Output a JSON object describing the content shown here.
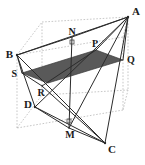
{
  "figure": {
    "background_color": "#ffffff",
    "stroke_color": "#2b2b2b",
    "hidden_edge_color": "#b9b9b9",
    "shade_fill": "#595959",
    "shade_stroke": "#3a3a3a",
    "width": 145,
    "height": 165
  },
  "labels": {
    "A": "A",
    "B": "B",
    "C": "C",
    "D": "D",
    "M": "M",
    "N": "N",
    "P": "P",
    "Q": "Q",
    "R": "R",
    "S": "S"
  },
  "points": {
    "A": {
      "x": 128,
      "y": 17
    },
    "B": {
      "x": 17,
      "y": 55
    },
    "C": {
      "x": 105,
      "y": 143
    },
    "D": {
      "x": 35,
      "y": 107
    },
    "M": {
      "x": 69,
      "y": 128
    },
    "N": {
      "x": 72,
      "y": 37
    },
    "P": {
      "x": 96,
      "y": 50
    },
    "Q": {
      "x": 123,
      "y": 60
    },
    "R": {
      "x": 42,
      "y": 86
    },
    "S": {
      "x": 22,
      "y": 73
    }
  },
  "cube_corners": {
    "front_top_left": {
      "x": 17,
      "y": 55
    },
    "front_top_right": {
      "x": 123,
      "y": 37
    },
    "front_bottom_left": {
      "x": 17,
      "y": 128
    },
    "front_bottom_right": {
      "x": 123,
      "y": 110
    },
    "back_top_left": {
      "x": 42,
      "y": 22
    },
    "back_top_right": {
      "x": 128,
      "y": 17
    },
    "back_bottom_left": {
      "x": 42,
      "y": 95
    },
    "back_bottom_right": {
      "x": 128,
      "y": 90
    }
  },
  "shaded_region": {
    "name": "parallelogram-SPQR-cross-section",
    "vertices": [
      {
        "x": 22,
        "y": 73
      },
      {
        "x": 96,
        "y": 50
      },
      {
        "x": 123,
        "y": 60
      },
      {
        "x": 48,
        "y": 83
      }
    ]
  },
  "solid_edges": [
    {
      "name": "edge-B-A",
      "from": "B",
      "to": "A"
    },
    {
      "name": "edge-B-C",
      "from": "B",
      "to": "C"
    },
    {
      "name": "edge-A-C",
      "from": "A",
      "to": "C"
    },
    {
      "name": "edge-B-D",
      "from": "B",
      "to": "D"
    },
    {
      "name": "edge-D-C",
      "from": "D",
      "to": "C"
    },
    {
      "name": "edge-A-D",
      "from": "A",
      "to": "D"
    },
    {
      "name": "edge-B-N",
      "from": "B",
      "to": "N"
    },
    {
      "name": "edge-N-A",
      "from": "N",
      "to": "A"
    },
    {
      "name": "edge-D-M",
      "from": "D",
      "to": "M"
    },
    {
      "name": "edge-M-C",
      "from": "M",
      "to": "C"
    },
    {
      "name": "edge-A-M",
      "from": "A",
      "to": "M"
    },
    {
      "name": "edge-A-Q",
      "from": "A",
      "to": "Q"
    },
    {
      "name": "edge-B-S",
      "from": "B",
      "to": "S"
    },
    {
      "name": "edge-S-R",
      "from": "S",
      "to": "R"
    },
    {
      "name": "edge-R-P",
      "from": "R",
      "to": "P"
    },
    {
      "name": "edge-P-A",
      "from": "P",
      "to": "A"
    },
    {
      "name": "edge-R-C",
      "from": "R",
      "to": "C"
    },
    {
      "name": "edge-N-M",
      "from": "N",
      "to": "M"
    }
  ],
  "right_angle_marks": [
    {
      "name": "right-angle-at-N",
      "x": 70,
      "y": 40
    },
    {
      "name": "right-angle-at-M",
      "x": 67,
      "y": 119
    }
  ]
}
